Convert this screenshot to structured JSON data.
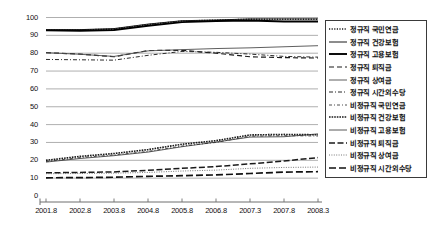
{
  "chart_data": {
    "type": "line",
    "title": "",
    "subtitle": "",
    "xlabel": "",
    "ylabel": "",
    "ylim": [
      0,
      100
    ],
    "yticks": [
      "0",
      "10",
      "20",
      "30",
      "40",
      "50",
      "60",
      "70",
      "80",
      "90",
      "100"
    ],
    "grid": true,
    "legend_position": "right",
    "x": [
      "2001.8",
      "2002.8",
      "2003.8",
      "2004.8",
      "2005.8",
      "2006.8",
      "2007.3",
      "2007.8",
      "2008.3"
    ],
    "series": [
      {
        "name": "정규직 국민연금",
        "style": "dotted",
        "color": "#1a1a1a",
        "values": [
          93.0,
          93.0,
          93.5,
          96.0,
          98.0,
          98.5,
          99.0,
          99.0,
          99.0
        ]
      },
      {
        "name": "정규직 건강보험",
        "style": "solid",
        "color": "#1a1a1a",
        "values": [
          93.2,
          93.2,
          93.8,
          96.3,
          98.2,
          98.6,
          99.2,
          99.2,
          99.2
        ]
      },
      {
        "name": "정규직 고용보험",
        "style": "solid-bold",
        "color": "#000000",
        "values": [
          92.8,
          92.6,
          93.0,
          95.4,
          97.4,
          98.0,
          98.3,
          97.8,
          97.8
        ]
      },
      {
        "name": "정규직 퇴직금",
        "style": "dashed",
        "color": "#1a1a1a",
        "values": [
          80.3,
          79.5,
          78.0,
          81.5,
          81.6,
          80.0,
          78.0,
          77.5,
          77.3
        ]
      },
      {
        "name": "정규직 상여금",
        "style": "solid-light",
        "color": "#4d4d4d",
        "values": [
          80.3,
          79.4,
          78.2,
          81.3,
          82.0,
          82.6,
          83.0,
          83.6,
          84.2
        ]
      },
      {
        "name": "정규직 시간외수당",
        "style": "dash-dot",
        "color": "#2b2b2b",
        "values": [
          76.5,
          76.3,
          76.1,
          78.8,
          81.0,
          80.5,
          79.5,
          78.2,
          77.8
        ]
      },
      {
        "name": "비정규직 국민연금",
        "style": "dash-dot-light",
        "color": "#3d3d3d",
        "values": [
          19.3,
          21.5,
          23.0,
          25.0,
          28.0,
          30.0,
          33.5,
          33.8,
          33.6
        ]
      },
      {
        "name": "비정규직 건강보험",
        "style": "dotted-dense",
        "color": "#1a1a1a",
        "values": [
          20.0,
          22.2,
          23.8,
          26.0,
          29.0,
          31.0,
          34.2,
          34.5,
          34.3
        ]
      },
      {
        "name": "비정규직 고용보험",
        "style": "solid-thin",
        "color": "#2e2e2e",
        "values": [
          19.0,
          21.0,
          22.6,
          24.6,
          27.6,
          30.2,
          33.0,
          33.2,
          34.8
        ]
      },
      {
        "name": "비정규직 퇴직금",
        "style": "dashed-long",
        "color": "#1a1a1a",
        "values": [
          13.0,
          13.2,
          13.5,
          14.4,
          15.5,
          16.5,
          18.0,
          19.6,
          21.5
        ]
      },
      {
        "name": "비정규직 상여금",
        "style": "dotted-fine",
        "color": "#555555",
        "values": [
          12.5,
          12.6,
          12.8,
          13.2,
          14.0,
          14.5,
          15.5,
          16.0,
          16.2
        ]
      },
      {
        "name": "비정규직 시간외수당",
        "style": "dashed-bold",
        "color": "#111111",
        "values": [
          10.2,
          10.3,
          10.5,
          11.0,
          11.4,
          11.8,
          12.6,
          13.4,
          13.6
        ]
      }
    ]
  },
  "axis": {
    "y_labels": [
      "100",
      "90",
      "80",
      "70",
      "60",
      "50",
      "40",
      "30",
      "20",
      "10",
      "0"
    ],
    "x_labels": [
      "2001.8",
      "2002.8",
      "2003.8",
      "2004.8",
      "2005.8",
      "2006.8",
      "2007.3",
      "2007.8",
      "2008.3"
    ]
  }
}
